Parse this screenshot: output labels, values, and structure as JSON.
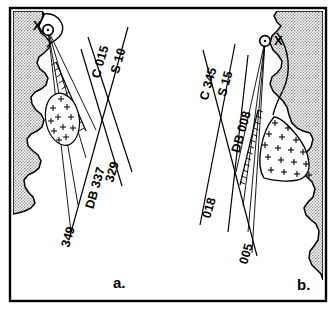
{
  "figure": {
    "type": "scientific-diagram",
    "panels": [
      {
        "id": "a",
        "label": "a.",
        "source_marker": "X",
        "source_marker_position": "left-of-circle",
        "bearing_lines": [
          {
            "name": "C 015",
            "label": "C 015"
          },
          {
            "name": "S 10",
            "label": "S 10"
          },
          {
            "name": "329",
            "label": "329"
          },
          {
            "name": "DB 337",
            "label": "DB 337"
          },
          {
            "name": "349",
            "label": "349"
          }
        ],
        "plus_zone": "stippled-plus-lens",
        "hatched_boundary": true
      },
      {
        "id": "b",
        "label": "b.",
        "source_marker": "X",
        "source_marker_position": "right-of-circle",
        "bearing_lines": [
          {
            "name": "C 345",
            "label": "C 345"
          },
          {
            "name": "S 15",
            "label": "S 15"
          },
          {
            "name": "DB 008",
            "label": "DB 008"
          },
          {
            "name": "018",
            "label": "018"
          },
          {
            "name": "005",
            "label": "005"
          }
        ],
        "plus_zone": "stippled-plus-patch",
        "hatched_boundary": true
      }
    ],
    "colors": {
      "ink": "#000000",
      "land_fill": "#c9c9c9",
      "background": "#ffffff",
      "border": "#000000"
    }
  }
}
